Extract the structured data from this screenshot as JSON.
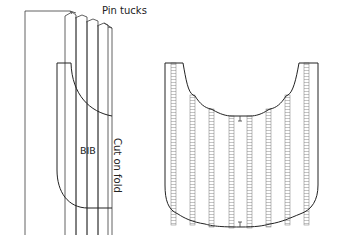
{
  "figure_left": {
    "labels": {
      "pin_tucks": "Pin tucks",
      "bib": "BIB",
      "cut_on_fold": "Cut on fold"
    }
  },
  "figure_right": {
    "description": "Bib piece with pin tucks stitched"
  },
  "colors": {
    "line": "#3a3a3a",
    "background": "#ffffff"
  }
}
